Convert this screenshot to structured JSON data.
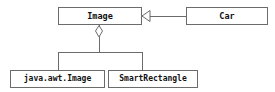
{
  "diagram": {
    "kind": "uml-class-diagram",
    "width": 275,
    "height": 92,
    "background_color": "#ffffff",
    "border_color": "#6b6b6b",
    "text_color": "#111111",
    "classes": [
      {
        "id": "image",
        "name": "Image",
        "x": 58,
        "y": 7,
        "width": 84,
        "height": 18
      },
      {
        "id": "car",
        "name": "Car",
        "x": 186,
        "y": 7,
        "width": 82,
        "height": 18
      },
      {
        "id": "java-awt-image",
        "name": "java.awt.Image",
        "x": 10,
        "y": 70,
        "width": 95,
        "height": 18
      },
      {
        "id": "smart-rectangle",
        "name": "SmartRectangle",
        "x": 108,
        "y": 70,
        "width": 90,
        "height": 18
      }
    ],
    "relationships": [
      {
        "id": "car-to-image",
        "type": "generalization",
        "from": "car",
        "to": "image",
        "marker": "hollow-triangle",
        "marker_direction": "left"
      },
      {
        "id": "image-aggregation",
        "type": "aggregation",
        "from": "image",
        "to": "subclasses",
        "marker": "hollow-diamond",
        "marker_direction": "up"
      },
      {
        "id": "image-to-java-awt-image",
        "type": "branch",
        "from": "image",
        "to": "java-awt-image"
      },
      {
        "id": "image-to-smart-rectangle",
        "type": "branch",
        "from": "image",
        "to": "smart-rectangle"
      }
    ]
  }
}
